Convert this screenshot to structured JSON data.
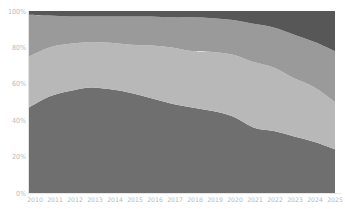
{
  "chart_data": {
    "type": "area",
    "stacked": true,
    "normalized": true,
    "title": "",
    "xlabel": "",
    "ylabel": "",
    "x": [
      2010,
      2011,
      2012,
      2013,
      2014,
      2015,
      2016,
      2017,
      2018,
      2019,
      2020,
      2021,
      2022,
      2023,
      2024,
      2025
    ],
    "x_tick_labels": [
      "2010",
      "2011",
      "2012",
      "2013",
      "2014",
      "2015",
      "2016",
      "2017",
      "2018",
      "2019",
      "2020",
      "2021",
      "2022",
      "2023",
      "2024",
      "2025"
    ],
    "y_tick_labels": [
      "0%",
      "20%",
      "40%",
      "60%",
      "80%",
      "100%"
    ],
    "ylim": [
      0,
      100
    ],
    "grid": false,
    "legend": null,
    "series": [
      {
        "name": "Series 1",
        "color": "#6f6f6f",
        "values": [
          47,
          53,
          56,
          58,
          57,
          55,
          52,
          49,
          47,
          45,
          42,
          36,
          34,
          31,
          28,
          24
        ]
      },
      {
        "name": "Series 2",
        "color": "#b8b8b8",
        "values": [
          28,
          27,
          26,
          25,
          25.5,
          26.5,
          29,
          31,
          31,
          32.5,
          34,
          36,
          35,
          32,
          30,
          26
        ]
      },
      {
        "name": "Series 3",
        "color": "#9a9a9a",
        "values": [
          23,
          17.5,
          15,
          14,
          14.5,
          15.5,
          16,
          16.5,
          18.5,
          18.5,
          19,
          21,
          22,
          24,
          25,
          28
        ]
      },
      {
        "name": "Series 4",
        "color": "#575757",
        "values": [
          2,
          2.5,
          3,
          3,
          3,
          3,
          3,
          3.5,
          3.5,
          4,
          5,
          7,
          9,
          13,
          17,
          22
        ]
      }
    ]
  },
  "layout": {
    "plot_left": 29,
    "plot_right": 335,
    "plot_top": 11,
    "plot_bottom": 193
  }
}
